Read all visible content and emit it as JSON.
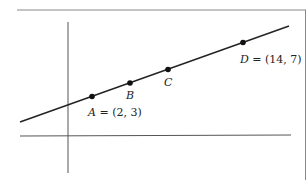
{
  "diagram": {
    "type": "coordinate-line",
    "points": [
      {
        "name": "A",
        "label": "A",
        "value": " = (2, 3)",
        "x": 2,
        "y": 3
      },
      {
        "name": "B",
        "label": "B",
        "value": "",
        "x": null,
        "y": null
      },
      {
        "name": "C",
        "label": "C",
        "value": "",
        "x": null,
        "y": null
      },
      {
        "name": "D",
        "label": "D",
        "value": " = (14, 7)",
        "x": 14,
        "y": 7
      }
    ],
    "colors": {
      "line": "#222222",
      "axis": "#555555",
      "border": "#888888",
      "point": "#111111"
    }
  }
}
